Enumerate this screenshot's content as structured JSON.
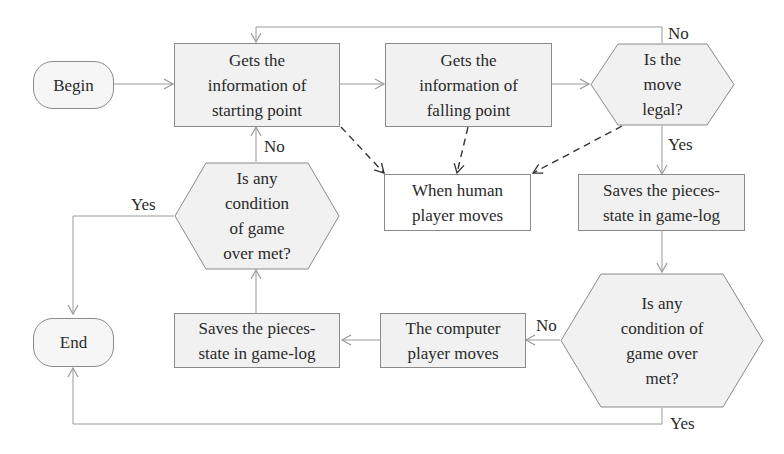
{
  "diagram": {
    "type": "flowchart",
    "nodes": {
      "begin": {
        "label": "Begin",
        "shape": "terminator"
      },
      "start_info": {
        "label": "Gets the\ninformation of\nstarting point",
        "shape": "process"
      },
      "fall_info": {
        "label": "Gets the\ninformation of\nfalling point",
        "shape": "process"
      },
      "legal": {
        "label": "Is the\nmove\nlegal?",
        "shape": "decision"
      },
      "human": {
        "label": "When human\nplayer moves",
        "shape": "process-white"
      },
      "save1": {
        "label": "Saves the pieces-\nstate in game-log",
        "shape": "process"
      },
      "over1": {
        "label": "Is any\ncondition of\ngame over\nmet?",
        "shape": "decision"
      },
      "computer": {
        "label": "The computer\nplayer moves",
        "shape": "process"
      },
      "save2": {
        "label": "Saves the pieces-\nstate in game-log",
        "shape": "process"
      },
      "over2": {
        "label": "Is any\ncondition\nof game\nover met?",
        "shape": "decision"
      },
      "end": {
        "label": "End",
        "shape": "terminator"
      }
    },
    "edge_labels": {
      "legal_no": "No",
      "legal_yes": "Yes",
      "over1_no": "No",
      "over1_yes": "Yes",
      "over2_no": "No",
      "over2_yes": "Yes"
    },
    "edges": [
      {
        "from": "begin",
        "to": "start_info"
      },
      {
        "from": "start_info",
        "to": "fall_info"
      },
      {
        "from": "fall_info",
        "to": "legal"
      },
      {
        "from": "legal",
        "to": "start_info",
        "label": "No"
      },
      {
        "from": "legal",
        "to": "save1",
        "label": "Yes"
      },
      {
        "from": "save1",
        "to": "over1"
      },
      {
        "from": "over1",
        "to": "computer",
        "label": "No"
      },
      {
        "from": "over1",
        "to": "end",
        "label": "Yes"
      },
      {
        "from": "computer",
        "to": "save2"
      },
      {
        "from": "save2",
        "to": "over2"
      },
      {
        "from": "over2",
        "to": "start_info",
        "label": "No"
      },
      {
        "from": "over2",
        "to": "end",
        "label": "Yes"
      },
      {
        "from": "start_info",
        "to": "human",
        "style": "dashed"
      },
      {
        "from": "fall_info",
        "to": "human",
        "style": "dashed"
      },
      {
        "from": "legal",
        "to": "human",
        "style": "dashed"
      }
    ],
    "colors": {
      "line": "#9a9a9a",
      "fill": "#f1f1f1",
      "border": "#8a8a8a",
      "dashed": "#333333"
    }
  }
}
